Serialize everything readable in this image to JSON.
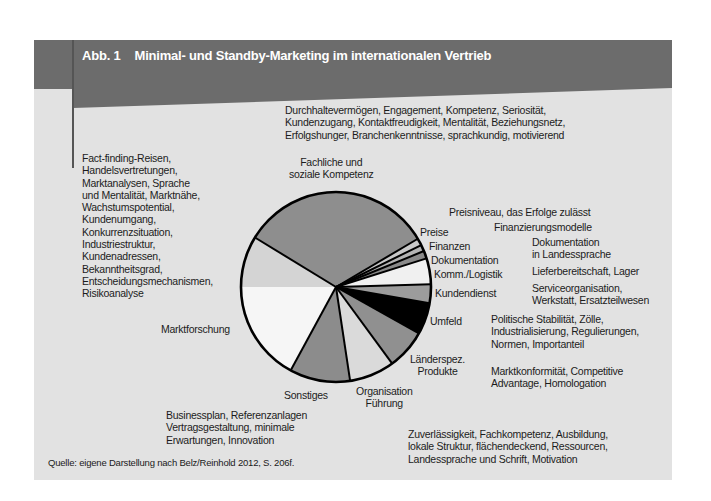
{
  "figure": {
    "number": "Abb. 1",
    "title": "Minimal- und Standby-Marketing im internationalen Vertrieb",
    "source": "Quelle: eigene Darstellung nach Belz/Reinhold 2012, S. 206f."
  },
  "colors": {
    "band": "#6c6c6c",
    "panel": "#e2e2e2",
    "outline": "#000000"
  },
  "descriptions": {
    "fachliche": "Durchhaltevermögen, Engagement, Kompetenz, Seriosität,\nKundenzugang, Kontaktfreudigkeit, Mentalität, Beziehungsnetz,\nErfolgshunger, Branchenkenntnisse, sprachkundig, motivierend",
    "marktforschung": "Fact-finding-Reisen,\nHandelsvertretungen,\nMarktanalysen, Sprache\nund Mentalität, Marktnähe,\nWachstumspotential,\nKundenumgang,\nKonkurrenzsituation,\nIndustriestruktur,\nKundenadressen,\nBekanntheitsgrad,\nEntscheidungsmechanismen,\nRisikoanalyse",
    "preise": "Preisniveau, das Erfolge zulässt",
    "finanzen": "Finanzierungsmodelle",
    "dokumentation": "Dokumentation\nin Landessprache",
    "logistik": "Lieferbereitschaft, Lager",
    "kundendienst": "Serviceorganisation,\nWerkstatt, Ersatzteilwesen",
    "umfeld": "Politische Stabilität, Zölle,\nIndustrialisierung, Regulierungen,\nNormen, Importanteil",
    "laenderspez": "Marktkonformität, Competitive\nAdvantage, Homologation",
    "organisation": "Zuverlässigkeit, Fachkompetenz, Ausbildung,\nlokale Struktur, flächendeckend, Ressourcen,\nLandessprache und Schrift, Motivation",
    "sonstiges": "Businessplan, Referenzanlagen\nVertragsgestaltung, minimale\nErwartungen, Innovation"
  },
  "slice_labels": {
    "fachliche": "Fachliche und\nsoziale Kompetenz",
    "preise": "Preise",
    "finanzen": "Finanzen",
    "dokumentation": "Dokumentation",
    "logistik": "Komm./Logistik",
    "kundendienst": "Kundendienst",
    "umfeld": "Umfeld",
    "laenderspez": "Länderspez.\nProdukte",
    "organisation": "Organisation\nFührung",
    "sonstiges": "Sonstiges",
    "marktforschung": "Marktforschung"
  },
  "chart_data": {
    "type": "pie",
    "title": "Minimal- und Standby-Marketing im internationalen Vertrieb",
    "start_angle_deg": 148.6,
    "direction": "clockwise",
    "categories": [
      "Fachliche und soziale Kompetenz",
      "Preise",
      "Finanzen",
      "Dokumentation",
      "Komm./Logistik",
      "Kundendienst",
      "Umfeld",
      "Länderspez. Produkte",
      "Organisation Führung",
      "Sonstiges",
      "Marktforschung"
    ],
    "values": [
      32.8,
      1.2,
      1.1,
      1.3,
      4.4,
      3.2,
      5.4,
      6.8,
      7.7,
      10.3,
      25.8
    ],
    "fills": [
      "#8e8e8e",
      "#c8c8c8",
      "#b4b4b4",
      "#8a8a8a",
      "#f0f0f0",
      "#9c9c9c",
      "#000000",
      "#909090",
      "#dadada",
      "#8c8c8c",
      "#f6f6f6"
    ],
    "legend": "none (direct labels)"
  }
}
